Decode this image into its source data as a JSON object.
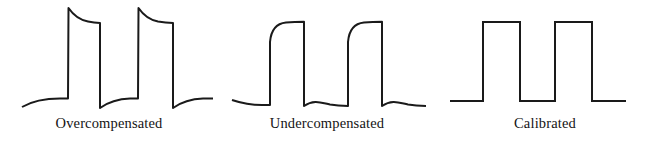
{
  "figure": {
    "background_color": "#ffffff",
    "trace_color": "#1a1a1a",
    "trace_width": 2,
    "label_color": "#141414"
  },
  "panels": [
    {
      "id": "overcompensated",
      "label": "Overcompensated",
      "description": "Square wave with overshoot spikes on rising edges that decay downward, and undershoot below baseline on falling edges that recovers upward",
      "trace_path": "M 22 107 C 34 100 46 98.5 60 98.5 L 68 98.5 L 68.5 8 C 74 16 80 20 88 21.5 C 93 22.4 97 22.8 100 23 L 100 108 C 110 101 120 99 130 98.6 L 138 98.5 L 138.5 8 C 144 16 150 20 158 21.5 C 164 22.4 169 22.8 173 23 L 173 108 C 183 101 193 99 203 98.6 L 213 98.5",
      "viewbox": "0 0 218 118"
    },
    {
      "id": "undercompensated",
      "label": "Undercompensated",
      "description": "Square wave with rounded, slow rising edges and exponential decay droop on the low baseline after falling edges",
      "trace_path": "M 14 100 C 26 104 34 105 44 105 L 52 105 L 52 42 C 53 30 58 23.5 68 22.5 C 74 22 80 21.8 86 21.8 L 86 106 C 96 99 104 103 112 104.5 C 118 105.4 124 105.8 130 106 L 130 42 C 131 30 136 23.5 146 22.5 C 152 22 158 21.8 164 21.8 L 164 106 C 174 99 182 103 190 104.5 C 196 105.4 202 105.8 208 106",
      "viewbox": "0 0 218 118"
    },
    {
      "id": "calibrated",
      "label": "Calibrated",
      "description": "Ideal square wave with flat tops, flat baseline and sharp vertical transitions",
      "trace_path": "M 14 101 L 47 101 L 47 22 L 84 22 L 84 101 L 119 101 L 119 22 L 156 22 L 156 101 L 190 101",
      "viewbox": "0 0 218 118"
    }
  ]
}
